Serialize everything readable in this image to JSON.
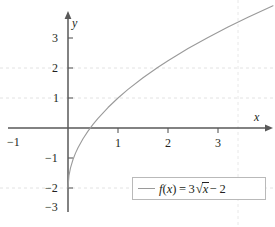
{
  "chart_data": {
    "type": "line",
    "title": "",
    "xlabel": "x",
    "ylabel": "y",
    "function": "f(x) = 3√x − 2",
    "expression_parts": {
      "fname": "f",
      "arg": "x",
      "equals": "=",
      "coefficient": "3",
      "radicand": "x",
      "constant": "− 2"
    },
    "xlim": [
      -1.35,
      4.1
    ],
    "ylim": [
      -3.3,
      3.85
    ],
    "grid": true,
    "grid_style": "dashed",
    "legend_position": "bottom-right",
    "x_ticks": [
      1,
      2,
      3
    ],
    "x_tick_labels": [
      "1",
      "2",
      "3"
    ],
    "y_ticks": [
      3,
      2,
      1,
      -1,
      -2,
      -3
    ],
    "y_tick_labels": [
      "3",
      "2",
      "1",
      "−1",
      "−2",
      "−3"
    ],
    "extra_x_axis_labels": [
      {
        "value": -1,
        "label": "−1"
      }
    ],
    "x_grid_values": [
      3.4
    ],
    "y_grid_values": [
      2,
      1,
      -2
    ],
    "series": [
      {
        "name": "f(x) = 3√x − 2",
        "color": "#9a9a9a",
        "x": [
          0,
          0.02,
          0.05,
          0.1,
          0.15,
          0.2,
          0.3,
          0.4,
          0.5,
          0.6,
          0.8,
          1.0,
          1.2,
          1.5,
          1.8,
          2.0,
          2.4,
          2.8,
          3.2,
          3.6,
          4.1
        ],
        "y": [
          -2,
          -1.576,
          -1.329,
          -1.051,
          -0.838,
          -0.658,
          -0.357,
          -0.103,
          0.121,
          0.324,
          0.683,
          1.0,
          1.286,
          1.674,
          2.024,
          2.243,
          2.647,
          3.019,
          3.367,
          3.693,
          4.073
        ]
      }
    ],
    "axis_color": "#595959",
    "grid_color": "#e0e0e0",
    "text_color": "#231f20"
  }
}
